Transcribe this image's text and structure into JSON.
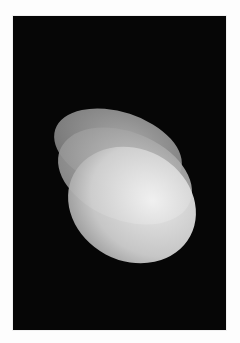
{
  "image": {
    "description": "Abstract photograph of three overlapping translucent white ellipses on a black background",
    "background_color": "#060606",
    "margin_color": "#fdfdfd",
    "shapes": [
      {
        "name": "top-ellipse",
        "cx": 105,
        "cy": 134,
        "rx": 66,
        "ry": 38,
        "rotate": 18,
        "fill": "#8f8f8f"
      },
      {
        "name": "middle-ellipse",
        "cx": 112,
        "cy": 160,
        "rx": 70,
        "ry": 44,
        "rotate": 22,
        "fill": "#b4b4b4"
      },
      {
        "name": "bottom-ellipse",
        "cx": 119,
        "cy": 189,
        "rx": 66,
        "ry": 56,
        "rotate": 28,
        "fill": "#d6d6d6"
      }
    ]
  }
}
